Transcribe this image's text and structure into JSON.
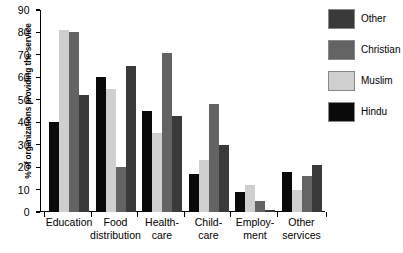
{
  "chart_data": {
    "type": "bar",
    "title": "",
    "xlabel": "",
    "ylabel": "% of organizations providing the service",
    "ylim": [
      0,
      90
    ],
    "yticks": [
      0,
      10,
      20,
      30,
      40,
      50,
      60,
      70,
      80,
      90
    ],
    "grid": false,
    "legend_position": "right",
    "categories": [
      "Education",
      "Food distribution",
      "Health-care",
      "Child-care",
      "Employment",
      "Other services"
    ],
    "category_lines": [
      [
        "Education",
        ""
      ],
      [
        "Food",
        "distribution"
      ],
      [
        "Health-",
        "care"
      ],
      [
        "Child-",
        "care"
      ],
      [
        "Employ-",
        "ment"
      ],
      [
        "Other",
        "services"
      ]
    ],
    "series": [
      {
        "name": "Hindu",
        "color": "#0a0a0a",
        "values": [
          40,
          60,
          45,
          17,
          9,
          18
        ]
      },
      {
        "name": "Muslim",
        "color": "#cfcfcf",
        "values": [
          81,
          55,
          35,
          23,
          12,
          10
        ]
      },
      {
        "name": "Christian",
        "color": "#636363",
        "values": [
          80,
          20,
          71,
          48,
          5,
          16
        ]
      },
      {
        "name": "Other",
        "color": "#3a3a3a",
        "values": [
          52,
          65,
          43,
          30,
          1,
          21
        ]
      }
    ],
    "legend_order": [
      "Other",
      "Christian",
      "Muslim",
      "Hindu"
    ]
  }
}
